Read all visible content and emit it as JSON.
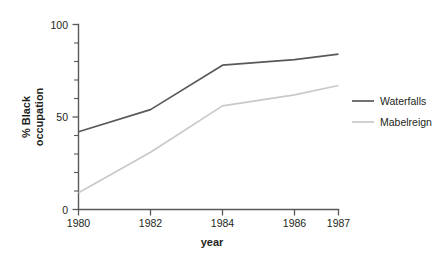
{
  "chart_data": {
    "type": "line",
    "title": "",
    "xlabel": "year",
    "ylabel": "% Black occupation",
    "x": [
      1980,
      1982,
      1984,
      1986,
      1987
    ],
    "xtick_labels": [
      "1980",
      "1982",
      "1984",
      "1986",
      "1987"
    ],
    "ytick_labels": [
      "0",
      "50",
      "100"
    ],
    "ytick_values": [
      0,
      50,
      100
    ],
    "yminor_values": [
      10,
      20,
      30,
      40,
      60,
      70,
      80,
      90
    ],
    "xlim": [
      1980,
      1987
    ],
    "ylim": [
      0,
      100
    ],
    "grid": false,
    "legend_position": "right",
    "series": [
      {
        "name": "Waterfalls",
        "color": "#595959",
        "values": [
          42,
          54,
          78,
          81,
          84
        ]
      },
      {
        "name": "Mabelreign",
        "color": "#c9c9c9",
        "values": [
          9,
          31,
          56,
          62,
          67
        ]
      }
    ]
  },
  "axis": {
    "y_label_line1": "% Black",
    "y_label_line2": "occupation",
    "x_label": "year"
  },
  "colors": {
    "axis": "#58595b",
    "text": "#231f20",
    "background": "#ffffff",
    "series_waterfalls": "#595959",
    "series_mabelreign": "#c9c9c9"
  }
}
